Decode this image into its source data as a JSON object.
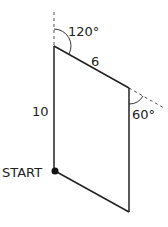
{
  "diagram": {
    "type": "path-parallelogram",
    "labels": {
      "angle_top": "120°",
      "side_top": "6",
      "side_left": "10",
      "angle_right": "60°",
      "start": "START"
    },
    "colors": {
      "line": "#222222",
      "dashed": "#555555",
      "background": "#ffffff"
    },
    "vertices": {
      "start": [
        55,
        171
      ],
      "top_left": [
        54,
        46
      ],
      "top_right": [
        129,
        88
      ],
      "bottom_right": [
        129,
        212
      ]
    }
  }
}
